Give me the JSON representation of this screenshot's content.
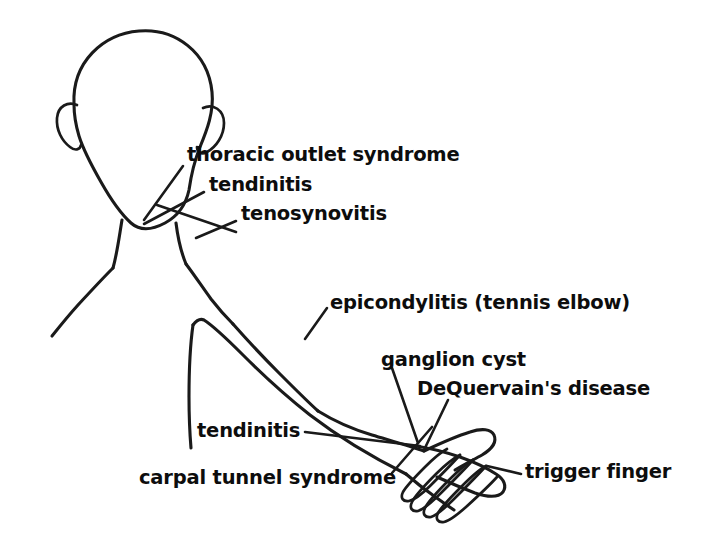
{
  "diagram": {
    "background_color": "#ffffff",
    "ink_color": "#1a1a1a",
    "labels": [
      {
        "id": "thoracic-outlet-syndrome",
        "text": "thoracic outlet syndrome",
        "target": "shoulder / clavicle"
      },
      {
        "id": "tendinitis-shoulder",
        "text": "tendinitis",
        "target": "shoulder"
      },
      {
        "id": "tenosynovitis",
        "text": "tenosynovitis",
        "target": "shoulder"
      },
      {
        "id": "epicondylitis",
        "text": "epicondylitis (tennis elbow)",
        "target": "elbow"
      },
      {
        "id": "ganglion-cyst",
        "text": "ganglion cyst",
        "target": "wrist"
      },
      {
        "id": "dequervains-disease",
        "text": "DeQuervain's disease",
        "target": "thumb side of wrist"
      },
      {
        "id": "tendinitis-forearm",
        "text": "tendinitis",
        "target": "forearm"
      },
      {
        "id": "carpal-tunnel-syndrome",
        "text": "carpal tunnel syndrome",
        "target": "wrist"
      },
      {
        "id": "trigger-finger",
        "text": "trigger finger",
        "target": "fingers"
      }
    ]
  }
}
